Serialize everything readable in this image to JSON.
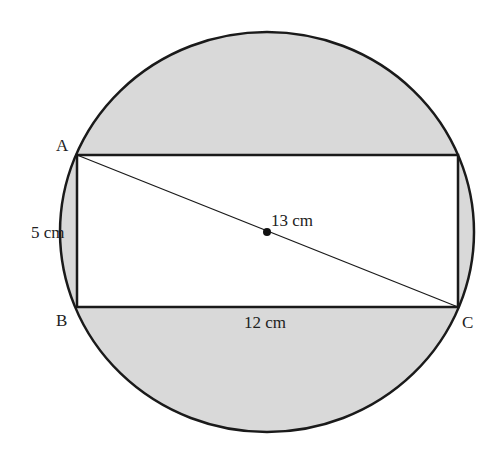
{
  "diagram": {
    "type": "geometry",
    "points": {
      "A": "A",
      "B": "B",
      "C": "C"
    },
    "labels": {
      "side_ab": "5 cm",
      "side_bc": "12 cm",
      "diagonal": "13 cm"
    },
    "colors": {
      "shade": "#d9d9d9",
      "stroke": "#1a1a1a",
      "fill_rect": "#ffffff"
    }
  }
}
